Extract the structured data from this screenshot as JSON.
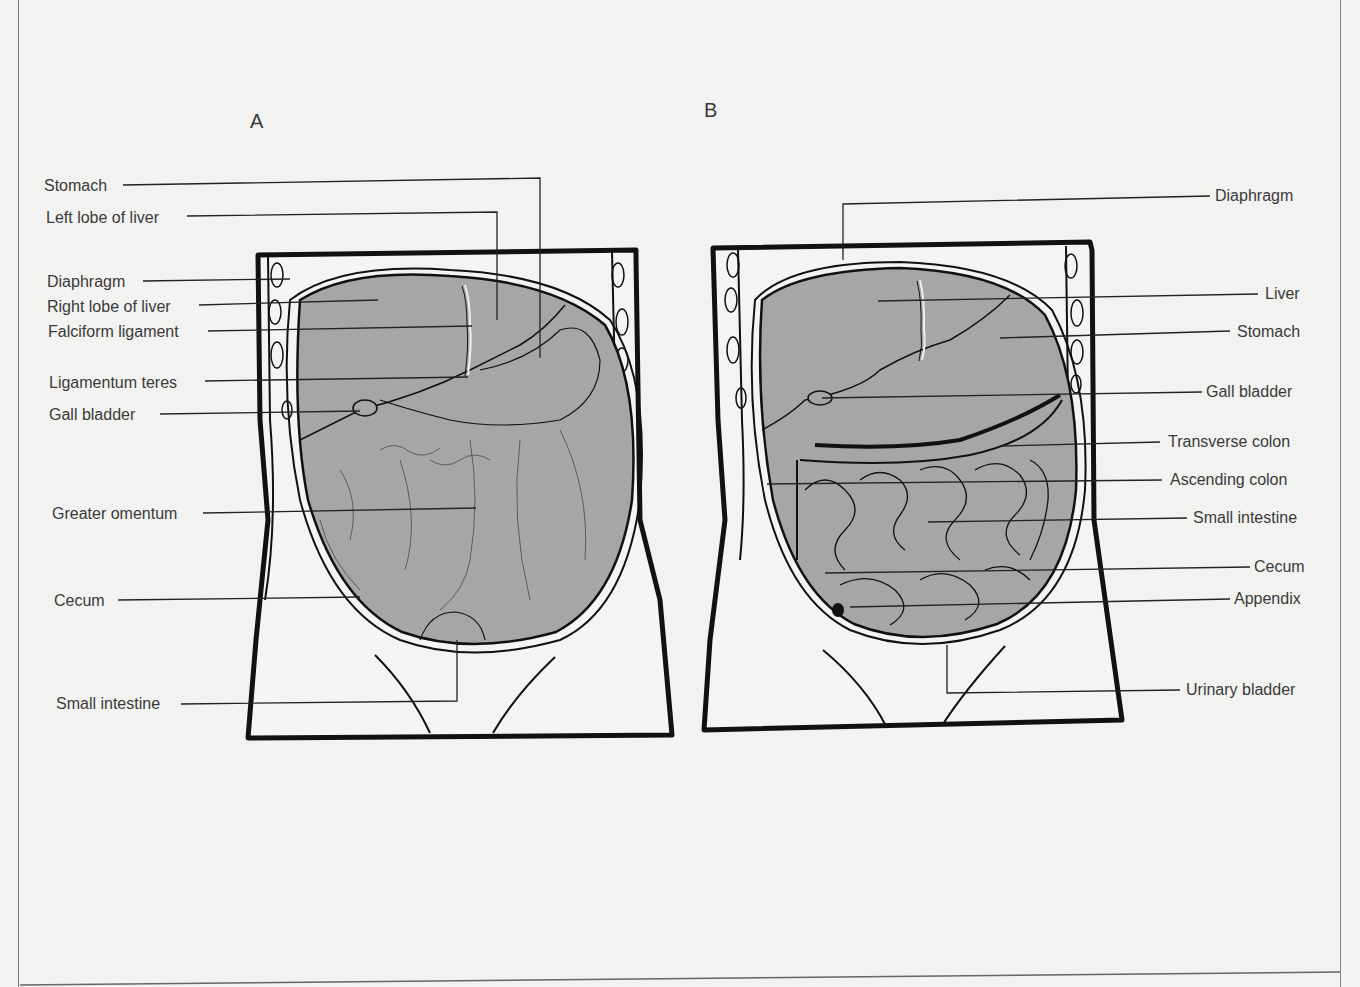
{
  "panels": [
    {
      "letter": "A",
      "labels": [
        "Stomach",
        "Left lobe of liver",
        "Diaphragm",
        "Right lobe of liver",
        "Falciform ligament",
        "Ligamentum teres",
        "Gall bladder",
        "Greater omentum",
        "Cecum",
        "Small intestine"
      ]
    },
    {
      "letter": "B",
      "labels": [
        "Diaphragm",
        "Liver",
        "Stomach",
        "Gall bladder",
        "Transverse colon",
        "Ascending colon",
        "Small intestine",
        "Cecum",
        "Appendix",
        "Urinary bladder"
      ]
    }
  ],
  "colors": {
    "background": "#f2f2f0",
    "organ_fill": "#a6a6a6",
    "outline": "#1a1a1a"
  }
}
